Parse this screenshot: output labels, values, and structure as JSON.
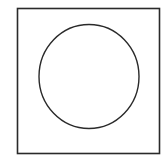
{
  "diagram": {
    "background": "#ffffff",
    "stroke_color": "#2a2a2a",
    "square": {
      "x": 17.5,
      "y": 8.5,
      "width": 142,
      "height": 145,
      "stroke_width": 1.6
    },
    "circle": {
      "cx": 89,
      "cy": 76.5,
      "rx": 50,
      "ry": 52,
      "stroke_width": 1.4
    }
  }
}
